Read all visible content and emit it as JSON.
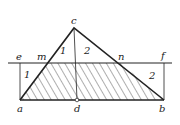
{
  "diagram": {
    "labels": {
      "apex": "c",
      "left_top": "e",
      "m": "m",
      "n": "n",
      "right_top": "f",
      "region_1_upper": "1",
      "region_2_upper": "2",
      "region_1_lower": "1",
      "region_2_lower": "2",
      "a": "a",
      "d": "d",
      "b": "b"
    },
    "colors": {
      "line": "#222222",
      "hatch": "#333333",
      "background": "#ffffff"
    }
  }
}
